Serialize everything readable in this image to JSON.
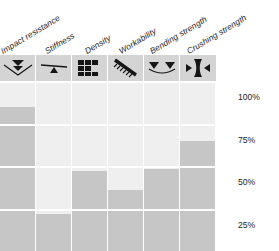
{
  "chart_data": {
    "type": "bar",
    "title": "",
    "xlabel": "",
    "ylabel": "",
    "ylim": [
      0,
      100
    ],
    "grid": true,
    "legend": "none",
    "axis_position": "right",
    "categories": [
      "Impact resistance",
      "Stiffness",
      "Density",
      "Workability",
      "Bending strength",
      "Crushing strength"
    ],
    "values": [
      85,
      22,
      47,
      36,
      48,
      65
    ],
    "tick_labels": [
      "100%",
      "75%",
      "50%",
      "25%",
      "0%"
    ],
    "tick_values": [
      100,
      75,
      50,
      25,
      0
    ],
    "bar_color": "#c6c6c6",
    "track_color": "#efefef",
    "gridline_color": "#ffffff"
  },
  "columns": [
    {
      "label": "Impact resistance",
      "icon": "double-chevron-down-in-valley-icon",
      "value": 85
    },
    {
      "label": "Stiffness",
      "icon": "triangle-up-on-beam-icon",
      "value": 22
    },
    {
      "label": "Density",
      "icon": "block-pixels-icon",
      "value": 47
    },
    {
      "label": "Workability",
      "icon": "diagonal-saw-blade-icon",
      "value": 36
    },
    {
      "label": "Bending strength",
      "icon": "two-triangles-down-on-curve-icon",
      "value": 48
    },
    {
      "label": "Crushing strength",
      "icon": "compressed-hourglass-arrows-icon",
      "value": 65
    }
  ],
  "axis": {
    "ticks": [
      "100%",
      "75%",
      "50%",
      "25%",
      "0%"
    ]
  }
}
